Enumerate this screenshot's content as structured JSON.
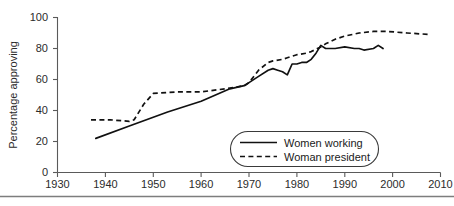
{
  "chart_data": {
    "type": "line",
    "title": "",
    "subtitle": "",
    "xlabel": "",
    "ylabel": "Percentage approving",
    "xlim": [
      1930,
      2010
    ],
    "ylim": [
      0,
      100
    ],
    "xticks": [
      1930,
      1940,
      1950,
      1960,
      1970,
      1980,
      1990,
      2000,
      2010
    ],
    "yticks": [
      0,
      20,
      40,
      60,
      80,
      100
    ],
    "grid": false,
    "legend_position": "inside-lower-right",
    "series": [
      {
        "name": "Women working",
        "style": "solid",
        "color": "#111111",
        "x": [
          1938,
          1945,
          1953,
          1960,
          1966,
          1969,
          1970,
          1972,
          1974,
          1975,
          1976,
          1977,
          1978,
          1979,
          1980,
          1981,
          1982,
          1983,
          1984,
          1985,
          1986,
          1988,
          1990,
          1992,
          1993,
          1994,
          1996,
          1997,
          1998
        ],
        "values": [
          22,
          30,
          39,
          46,
          54,
          56,
          58,
          62,
          66,
          67,
          66,
          65,
          63,
          70,
          70,
          71,
          71,
          73,
          77,
          82,
          80,
          80,
          81,
          80,
          80,
          79,
          80,
          82,
          80
        ]
      },
      {
        "name": "Woman president",
        "style": "dashed",
        "color": "#111111",
        "x": [
          1937,
          1941,
          1945,
          1946,
          1948,
          1950,
          1955,
          1960,
          1965,
          1969,
          1970,
          1972,
          1974,
          1975,
          1977,
          1978,
          1980,
          1982,
          1983,
          1985,
          1986,
          1988,
          1990,
          1993,
          1996,
          1999,
          2003,
          2008
        ],
        "values": [
          34,
          34,
          33,
          34,
          44,
          51,
          52,
          52,
          54,
          56,
          58,
          66,
          71,
          72,
          73,
          74,
          76,
          77,
          78,
          81,
          83,
          86,
          88,
          90,
          91,
          91,
          90,
          89
        ]
      }
    ]
  },
  "axis": {
    "y_title": "Percentage approving",
    "y_tick_labels": [
      "0",
      "20",
      "40",
      "60",
      "80",
      "100"
    ],
    "x_tick_labels": [
      "1930",
      "1940",
      "1950",
      "1960",
      "1970",
      "1980",
      "1990",
      "2000",
      "2010"
    ]
  },
  "legend": {
    "entries": [
      {
        "label": "Women working",
        "style": "solid"
      },
      {
        "label": "Woman president",
        "style": "dashed"
      }
    ]
  }
}
